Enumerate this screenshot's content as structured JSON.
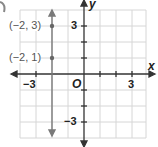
{
  "graph": {
    "type": "coordinate-plane",
    "grid": {
      "x_min": -4,
      "x_max": 4,
      "y_min": -4,
      "y_max": 4,
      "step": 1
    },
    "axes": {
      "x_label": "x",
      "y_label": "y",
      "origin_label": "O"
    },
    "ticks": {
      "x_neg": "−3",
      "x_pos": "3",
      "y_pos": "3",
      "y_neg": "−3"
    },
    "points": [
      {
        "x": -2,
        "y": 3,
        "label": "(−2, 3)"
      },
      {
        "x": -2,
        "y": 1,
        "label": "(−2, 1)"
      }
    ],
    "line": {
      "equation": "x = -2",
      "direction": "vertical",
      "arrows": "both"
    },
    "colors": {
      "grid": "#d0d0d0",
      "axis": "#333333",
      "line": "#7a7a7a",
      "point": "#6a6a6a"
    }
  }
}
